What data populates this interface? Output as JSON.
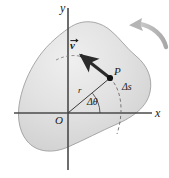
{
  "figure": {
    "colors": {
      "body_fill_light": "#e8e8e8",
      "body_fill_mid": "#dcdcdc",
      "body_fill_dark": "#cfcfcf",
      "body_outline": "#9a9a9a",
      "axis": "#4a4a4a",
      "vector": "#2b2b2b",
      "radius_line": "#3a3a3a",
      "dashed": "#6b6b6b",
      "curved_arrow": "#b0b0b0",
      "point_marker": "#111111",
      "background": "#ffffff"
    },
    "labels": {
      "y_axis": "y",
      "x_axis": "x",
      "origin": "O",
      "point": "P",
      "radius": "r",
      "delta_theta": "Δθ",
      "delta_s": "Δs",
      "velocity": "v"
    },
    "geometry": {
      "origin_px": [
        68,
        113
      ],
      "point_P_px": [
        110,
        78
      ],
      "vector_tip_px": [
        77,
        52
      ],
      "x_axis_span_px": [
        14,
        152
      ],
      "y_axis_span_px": [
        8,
        170
      ],
      "arc_start_px": [
        110,
        78
      ],
      "arc_end_px": [
        117,
        134
      ],
      "curved_arrow_start_px": [
        166,
        45
      ],
      "curved_arrow_end_px": [
        132,
        25
      ]
    },
    "annotations": {
      "rotation_sense": "counterclockwise",
      "velocity_direction": "tangential, perpendicular to radius r",
      "arc_meaning": "arc length traversed"
    }
  }
}
